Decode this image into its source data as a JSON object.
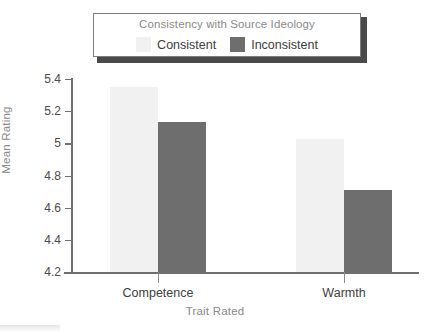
{
  "chart_data": {
    "type": "bar",
    "title": "",
    "xlabel": "Trait Rated",
    "ylabel": "Mean Rating",
    "categories": [
      "Competence",
      "Warmth"
    ],
    "series": [
      {
        "name": "Consistent",
        "values": [
          5.35,
          5.03
        ],
        "color": "#f1f1f1"
      },
      {
        "name": "Inconsistent",
        "values": [
          5.13,
          4.71
        ],
        "color": "#6e6e6e"
      }
    ],
    "ylim": [
      4.2,
      5.4
    ],
    "yticks": [
      4.2,
      4.4,
      4.6,
      4.8,
      5,
      5.2,
      5.4
    ],
    "ytick_labels": [
      "4.2",
      "4.4",
      "4.6",
      "4.8",
      "5",
      "5.2",
      "5.4"
    ],
    "grid": false,
    "legend": {
      "position": "top",
      "title": "Consistency with Source Ideology",
      "entries": [
        "Consistent",
        "Inconsistent"
      ]
    }
  },
  "legend": {
    "title": "Consistency with Source Ideology",
    "items": [
      {
        "label": "Consistent",
        "color": "#f1f1f1"
      },
      {
        "label": "Inconsistent",
        "color": "#6e6e6e"
      }
    ]
  },
  "axes": {
    "y_title": "Mean Rating",
    "x_title": "Trait Rated",
    "y_ticks": [
      "5.4",
      "5.2",
      "5",
      "4.8",
      "4.6",
      "4.4",
      "4.2"
    ],
    "x_categories": [
      "Competence",
      "Warmth"
    ]
  },
  "colors": {
    "consistent": "#f1f1f1",
    "inconsistent": "#6e6e6e",
    "axis": "#6f6f6f",
    "muted_text": "#8a8a8a",
    "text": "#3d3d3d"
  }
}
